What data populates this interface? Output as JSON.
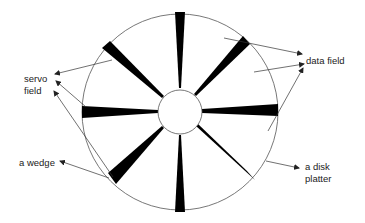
{
  "diagram": {
    "platter": {
      "cx": 180,
      "cy": 112,
      "r": 98,
      "stroke": "#555555"
    },
    "hub": {
      "cx": 180,
      "cy": 112,
      "r": 22
    },
    "wedge_count": 8,
    "wedge_color": "#000000",
    "labels": {
      "servo_field_line1": "servo",
      "servo_field_line2": "field",
      "data_field": "data field",
      "a_wedge": "a wedge",
      "a_disk_platter_line1": "a disk",
      "a_disk_platter_line2": "platter"
    }
  }
}
